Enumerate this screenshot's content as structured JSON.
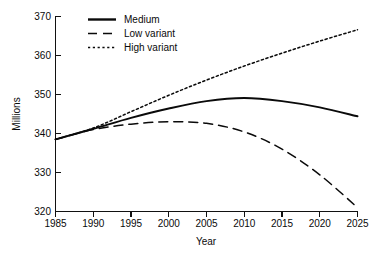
{
  "chart_data": {
    "type": "line",
    "title": "",
    "xlabel": "Year",
    "ylabel": "Millions",
    "xlim": [
      1985,
      2025
    ],
    "ylim": [
      320,
      370
    ],
    "xticks": [
      1985,
      1990,
      1995,
      2000,
      2005,
      2010,
      2015,
      2020,
      2025
    ],
    "yticks": [
      320,
      330,
      340,
      350,
      360,
      370
    ],
    "grid": false,
    "legend_position": "top-left",
    "x": [
      1985,
      1990,
      1995,
      2000,
      2005,
      2010,
      2015,
      2020,
      2025
    ],
    "series": [
      {
        "name": "Medium",
        "style": "solid",
        "values": [
          338.5,
          341.2,
          344.0,
          346.4,
          348.3,
          349.1,
          348.3,
          346.7,
          344.4
        ]
      },
      {
        "name": "Low variant",
        "style": "dashed",
        "values": [
          338.5,
          341.0,
          342.4,
          343.0,
          342.6,
          340.4,
          336.0,
          329.4,
          321.0
        ]
      },
      {
        "name": "High variant",
        "style": "dotted",
        "values": [
          338.5,
          341.4,
          345.6,
          349.8,
          353.7,
          357.3,
          360.6,
          363.7,
          366.6
        ]
      }
    ],
    "xtick_labels": [
      "1985",
      "1990",
      "1995",
      "2000",
      "2005",
      "2010",
      "2015",
      "2020",
      "2025"
    ],
    "ytick_labels": [
      "320",
      "330",
      "340",
      "350",
      "360",
      "370"
    ],
    "legend_entries": [
      "Medium",
      "Low variant",
      "High variant"
    ]
  },
  "axes": {
    "y_axis_title": "Millions",
    "x_axis_title": "Year"
  },
  "legend": {
    "medium_label": "Medium",
    "low_label": "Low variant",
    "high_label": "High variant"
  },
  "yticks": {
    "t0": "320",
    "t1": "330",
    "t2": "340",
    "t3": "350",
    "t4": "360",
    "t5": "370"
  },
  "xticks": {
    "t0": "1985",
    "t1": "1990",
    "t2": "1995",
    "t3": "2000",
    "t4": "2005",
    "t5": "2010",
    "t6": "2015",
    "t7": "2020",
    "t8": "2025"
  },
  "colors": {
    "ink": "#0a0a0a",
    "background": "#ffffff"
  }
}
